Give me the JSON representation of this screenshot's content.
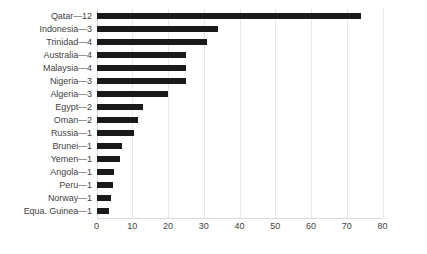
{
  "chart_data": {
    "type": "bar",
    "orientation": "horizontal",
    "title": "",
    "xlabel": "",
    "ylabel": "",
    "xlim": [
      0,
      80
    ],
    "xticks": [
      0,
      10,
      20,
      30,
      40,
      50,
      60,
      70,
      80
    ],
    "grid": true,
    "legend": false,
    "bar_color": "#1a1a1a",
    "gridline_color": "#e9e9e9",
    "text_color": "#3f3f3f",
    "background": "#ffffff",
    "categories": [
      "Qatar—12",
      "Indonesia—3",
      "Trinidad—4",
      "Australia—4",
      "Malaysia—4",
      "Nigeria—3",
      "Algeria—3",
      "Egypt—2",
      "Oman—2",
      "Russia—1",
      "Brunei—1",
      "Yemen—1",
      "Angola—1",
      "Peru—1",
      "Norway—1",
      "Equa. Guinea—1"
    ],
    "values": [
      74,
      34,
      31,
      25,
      25,
      25,
      20,
      13,
      11.5,
      10.5,
      7,
      6.5,
      5,
      4.5,
      4,
      3.5
    ]
  }
}
